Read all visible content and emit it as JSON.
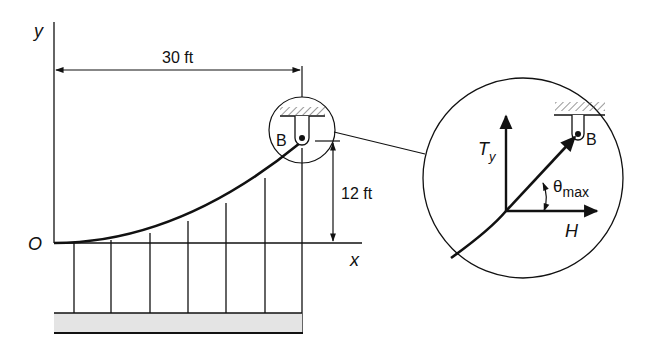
{
  "diagram": {
    "type": "cable-suspension-free-body",
    "labels": {
      "y_axis": "y",
      "x_axis": "x",
      "origin": "O",
      "span_dimension": "30 ft",
      "sag_dimension": "12 ft",
      "support_point": "B",
      "detail_support_point": "B",
      "tension_vertical": "T",
      "tension_vertical_sub": "y",
      "horizontal_force": "H",
      "angle": "θ",
      "angle_sub": "max"
    },
    "colors": {
      "ink": "#111111",
      "ground_fill": "#e4e4e4",
      "background": "#ffffff"
    },
    "hangers": {
      "count": 6
    }
  }
}
